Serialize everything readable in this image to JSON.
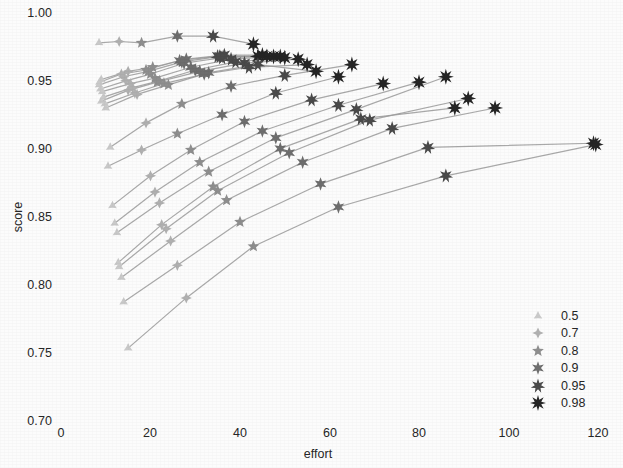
{
  "chart_data": {
    "type": "line",
    "title": "",
    "xlabel": "effort",
    "ylabel": "score",
    "xlim": [
      0,
      123
    ],
    "ylim": [
      0.7,
      1.0
    ],
    "xticks": [
      0,
      20,
      40,
      60,
      80,
      100,
      120
    ],
    "xtick_labels": [
      "0",
      "20",
      "40",
      "60",
      "80",
      "100",
      "120"
    ],
    "yticks": [
      0.7,
      0.75,
      0.8,
      0.85,
      0.9,
      0.95,
      1.0
    ],
    "ytick_labels": [
      "0.70",
      "0.75",
      "0.80",
      "0.85",
      "0.90",
      "0.95",
      "1.00"
    ],
    "grid": false,
    "legend_position": "lower right",
    "legend_title": "",
    "marker_levels": [
      {
        "label": "0.5",
        "value": 0.5,
        "color": "#c9c9c9",
        "points": 3,
        "size": 5.0
      },
      {
        "label": "0.7",
        "value": 0.7,
        "color": "#b0b0b0",
        "points": 4,
        "size": 5.6
      },
      {
        "label": "0.8",
        "value": 0.8,
        "color": "#8e8e8e",
        "points": 5,
        "size": 6.2
      },
      {
        "label": "0.9",
        "value": 0.9,
        "color": "#6e6e6e",
        "points": 6,
        "size": 6.8
      },
      {
        "label": "0.95",
        "value": 0.95,
        "color": "#4a4a4a",
        "points": 7,
        "size": 7.4
      },
      {
        "label": "0.98",
        "value": 0.98,
        "color": "#252525",
        "points": 8,
        "size": 8.0
      }
    ],
    "line_color": "#9a9a9a",
    "series": [
      {
        "name": "traj-01",
        "x": [
          8.5,
          13.0,
          18.0,
          26.0,
          34.0,
          43.0
        ],
        "y": [
          0.978,
          0.979,
          0.978,
          0.983,
          0.983,
          0.977
        ]
      },
      {
        "name": "traj-02",
        "x": [
          9.0,
          15.0,
          20.5,
          28.0,
          36.5,
          45.0
        ],
        "y": [
          0.951,
          0.957,
          0.96,
          0.966,
          0.969,
          0.969
        ]
      },
      {
        "name": "traj-03",
        "x": [
          8.5,
          14.0,
          19.5,
          27.0,
          35.5,
          46.0
        ],
        "y": [
          0.947,
          0.953,
          0.957,
          0.964,
          0.968,
          0.968
        ]
      },
      {
        "name": "traj-04",
        "x": [
          8.8,
          14.5,
          20.0,
          27.5,
          36.0,
          47.5
        ],
        "y": [
          0.944,
          0.95,
          0.955,
          0.963,
          0.967,
          0.968
        ]
      },
      {
        "name": "traj-05",
        "x": [
          9.2,
          15.5,
          21.0,
          29.0,
          38.0,
          49.0
        ],
        "y": [
          0.942,
          0.948,
          0.952,
          0.96,
          0.966,
          0.968
        ]
      },
      {
        "name": "traj-06",
        "x": [
          8.6,
          13.5,
          19.0,
          26.5,
          35.0,
          44.0
        ],
        "y": [
          0.949,
          0.955,
          0.958,
          0.965,
          0.968,
          0.968
        ]
      },
      {
        "name": "traj-07",
        "x": [
          9.5,
          16.0,
          22.0,
          30.0,
          39.0,
          50.0
        ],
        "y": [
          0.938,
          0.945,
          0.95,
          0.958,
          0.964,
          0.967
        ]
      },
      {
        "name": "traj-08",
        "x": [
          9.0,
          15.0,
          21.5,
          31.0,
          41.0,
          53.0
        ],
        "y": [
          0.935,
          0.943,
          0.949,
          0.957,
          0.963,
          0.966
        ]
      },
      {
        "name": "traj-09",
        "x": [
          10.0,
          17.0,
          24.0,
          33.0,
          44.0,
          57.0
        ],
        "y": [
          0.93,
          0.94,
          0.947,
          0.956,
          0.962,
          0.957
        ]
      },
      {
        "name": "traj-10",
        "x": [
          9.8,
          16.5,
          23.0,
          32.0,
          42.0,
          55.0
        ],
        "y": [
          0.933,
          0.941,
          0.948,
          0.955,
          0.96,
          0.962
        ]
      },
      {
        "name": "traj-11",
        "x": [
          11.0,
          19.0,
          27.0,
          38.0,
          50.0,
          65.0
        ],
        "y": [
          0.901,
          0.919,
          0.933,
          0.946,
          0.954,
          0.962
        ]
      },
      {
        "name": "traj-12",
        "x": [
          10.5,
          18.0,
          26.0,
          36.0,
          48.0,
          62.0
        ],
        "y": [
          0.887,
          0.899,
          0.911,
          0.925,
          0.941,
          0.953
        ]
      },
      {
        "name": "traj-13",
        "x": [
          11.5,
          20.0,
          29.0,
          41.0,
          56.0,
          72.0
        ],
        "y": [
          0.858,
          0.88,
          0.899,
          0.92,
          0.936,
          0.948
        ]
      },
      {
        "name": "traj-14",
        "x": [
          12.0,
          21.0,
          31.0,
          45.0,
          62.0,
          80.0
        ],
        "y": [
          0.845,
          0.868,
          0.89,
          0.913,
          0.932,
          0.949
        ]
      },
      {
        "name": "traj-15",
        "x": [
          12.5,
          22.0,
          33.0,
          48.0,
          66.0,
          86.0
        ],
        "y": [
          0.838,
          0.86,
          0.883,
          0.908,
          0.929,
          0.953
        ]
      },
      {
        "name": "traj-16",
        "x": [
          13.0,
          23.5,
          35.0,
          51.0,
          69.0,
          91.0
        ],
        "y": [
          0.813,
          0.841,
          0.869,
          0.897,
          0.921,
          0.937
        ]
      },
      {
        "name": "traj-17",
        "x": [
          12.8,
          22.5,
          34.0,
          49.0,
          67.0,
          88.0
        ],
        "y": [
          0.816,
          0.844,
          0.872,
          0.9,
          0.922,
          0.93
        ]
      },
      {
        "name": "traj-18",
        "x": [
          13.5,
          24.5,
          37.0,
          54.0,
          74.0,
          97.0
        ],
        "y": [
          0.805,
          0.832,
          0.862,
          0.89,
          0.915,
          0.93
        ]
      },
      {
        "name": "traj-19",
        "x": [
          14.0,
          26.0,
          40.0,
          58.0,
          82.0,
          119.0
        ],
        "y": [
          0.787,
          0.814,
          0.846,
          0.874,
          0.901,
          0.904
        ]
      },
      {
        "name": "traj-20",
        "x": [
          15.0,
          28.0,
          43.0,
          62.0,
          86.0,
          119.5
        ],
        "y": [
          0.753,
          0.79,
          0.828,
          0.857,
          0.88,
          0.903
        ]
      }
    ]
  }
}
